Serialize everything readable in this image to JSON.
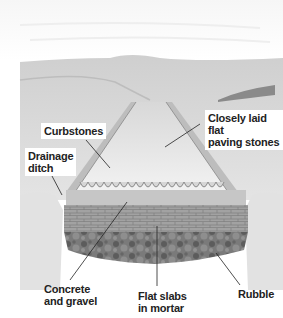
{
  "figure": {
    "labels": {
      "curbstones": "Curbstones",
      "paving": "Closely laid flat\npaving stones",
      "drainage": "Drainage\nditch",
      "concrete": "Concrete\nand gravel",
      "slabs": "Flat slabs\nin mortar",
      "rubble": "Rubble"
    },
    "colors": {
      "background": "#ffffff",
      "hills": "#d9d9d9",
      "road_surface": "#eeeeee",
      "gravel": "#c4c4c4",
      "slabs": "#9a9a9a",
      "rubble": "#6e6e6e",
      "leader_line": "#222222"
    }
  }
}
